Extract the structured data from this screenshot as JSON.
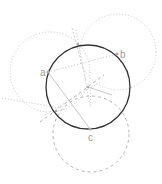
{
  "diagram": {
    "labels": {
      "a": "a",
      "b": "b",
      "c": "c"
    },
    "points": {
      "a": [
        48,
        72
      ],
      "b": [
        117,
        54
      ],
      "c": [
        90,
        129
      ]
    },
    "main_circle": {
      "cx": 88,
      "cy": 87,
      "r": 42,
      "color": "#333333"
    },
    "helper_circles": [
      {
        "name": "circle-a",
        "cx": 50,
        "cy": 72,
        "r": 40,
        "style": "dotted",
        "color": "#c8c8c8"
      },
      {
        "name": "circle-b",
        "cx": 118,
        "cy": 52,
        "r": 38,
        "style": "dotted",
        "color": "#c8c8c8"
      },
      {
        "name": "circle-c",
        "cx": 91,
        "cy": 134,
        "r": 38,
        "style": "dashed",
        "color": "#b4b4b4"
      }
    ],
    "colors": {
      "main": "#333333",
      "helper": "#c0c0c0",
      "label": "#999999"
    }
  }
}
